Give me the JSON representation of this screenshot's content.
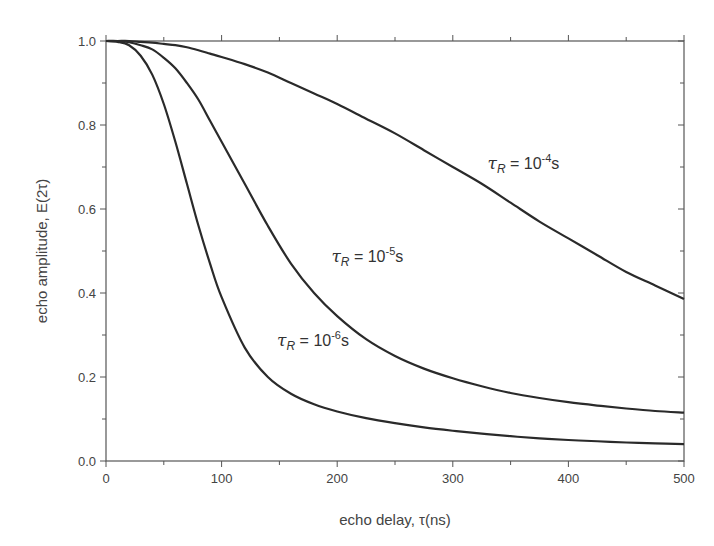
{
  "chart_data": {
    "type": "line",
    "title": "",
    "xlabel": "echo delay, τ(ns)",
    "ylabel": "echo amplitude, E(2τ)",
    "xlim": [
      0,
      500
    ],
    "ylim": [
      0.0,
      1.0
    ],
    "x_ticks": [
      "0",
      "100",
      "200",
      "300",
      "400",
      "500"
    ],
    "x_tick_values": [
      0,
      100,
      200,
      300,
      400,
      500
    ],
    "y_ticks": [
      "0.0",
      "0.2",
      "0.4",
      "0.6",
      "0.8",
      "1.0"
    ],
    "y_tick_values": [
      0.0,
      0.2,
      0.4,
      0.6,
      0.8,
      1.0
    ],
    "grid": false,
    "legend": "none (inline curve annotations)",
    "x": [
      0,
      10,
      20,
      30,
      40,
      50,
      60,
      70,
      80,
      90,
      100,
      120,
      140,
      160,
      180,
      200,
      225,
      250,
      275,
      300,
      325,
      350,
      375,
      400,
      425,
      450,
      475,
      500
    ],
    "series": [
      {
        "name": "τR = 10^-6 s",
        "values": [
          1.0,
          0.998,
          0.99,
          0.965,
          0.92,
          0.85,
          0.76,
          0.66,
          0.56,
          0.47,
          0.39,
          0.27,
          0.2,
          0.16,
          0.135,
          0.118,
          0.102,
          0.09,
          0.08,
          0.072,
          0.065,
          0.059,
          0.054,
          0.05,
          0.047,
          0.044,
          0.042,
          0.04
        ]
      },
      {
        "name": "τR = 10^-5 s",
        "values": [
          1.0,
          1.0,
          0.997,
          0.99,
          0.98,
          0.96,
          0.935,
          0.9,
          0.86,
          0.81,
          0.76,
          0.66,
          0.56,
          0.47,
          0.4,
          0.345,
          0.29,
          0.25,
          0.22,
          0.197,
          0.178,
          0.162,
          0.15,
          0.14,
          0.132,
          0.125,
          0.119,
          0.115
        ]
      },
      {
        "name": "τR = 10^-4 s",
        "values": [
          1.0,
          1.0,
          1.0,
          0.998,
          0.996,
          0.993,
          0.99,
          0.985,
          0.978,
          0.97,
          0.962,
          0.945,
          0.925,
          0.9,
          0.875,
          0.85,
          0.815,
          0.78,
          0.74,
          0.7,
          0.66,
          0.615,
          0.57,
          0.53,
          0.49,
          0.45,
          0.418,
          0.386
        ]
      }
    ],
    "annotations": [
      {
        "base": "τ",
        "sub": "R",
        "eq": " = 10",
        "sup": "-4",
        "unit": "s",
        "x": 330,
        "y": 0.695
      },
      {
        "base": "τ",
        "sub": "R",
        "eq": " = 10",
        "sup": "-5",
        "unit": "s",
        "x": 195,
        "y": 0.475
      },
      {
        "base": "τ",
        "sub": "R",
        "eq": " = 10",
        "sup": "-6",
        "unit": "s",
        "x": 148,
        "y": 0.275
      }
    ]
  }
}
